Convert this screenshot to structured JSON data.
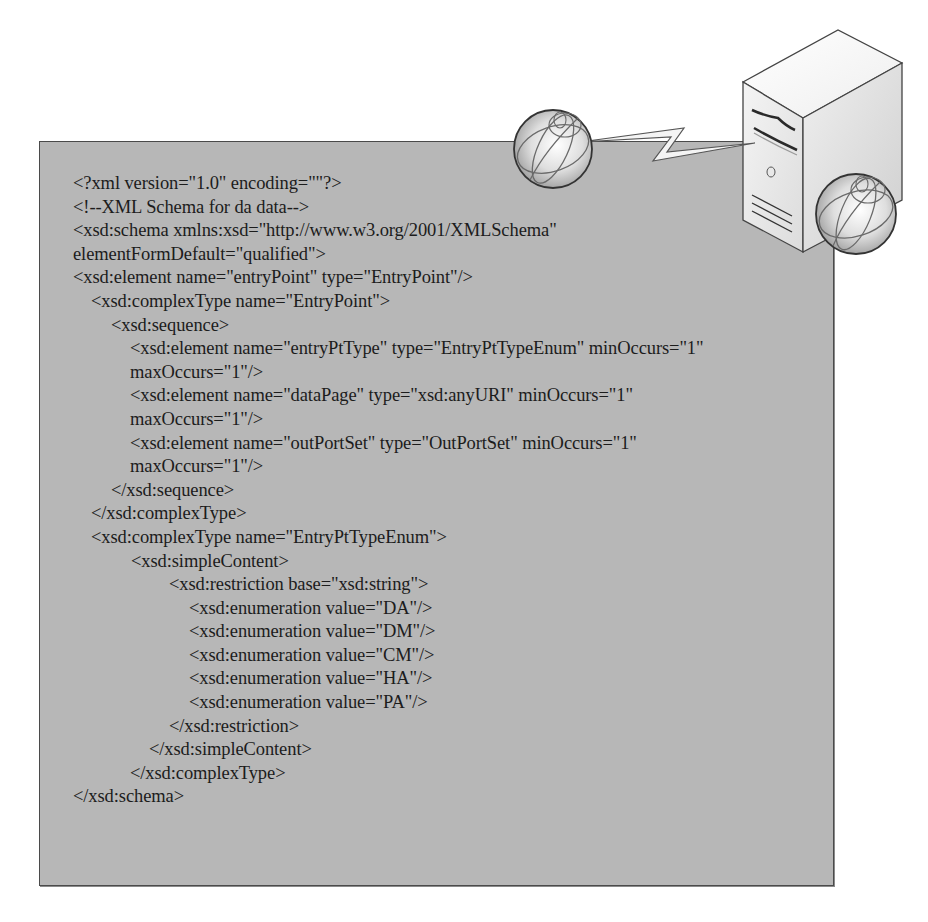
{
  "figure": {
    "panel": {
      "background": "#b7b7b7",
      "border": "#4a4a4a"
    },
    "code": {
      "language": "xml",
      "lines": [
        {
          "indent": 0,
          "text": "<?xml version=\"1.0\" encoding=\"\"?>"
        },
        {
          "indent": 0,
          "text": "<!--XML Schema for da data-->"
        },
        {
          "indent": 0,
          "text": "<xsd:schema xmlns:xsd=\"http://www.w3.org/2001/XMLSchema\""
        },
        {
          "indent": 0,
          "text": "elementFormDefault=\"qualified\">"
        },
        {
          "indent": 0,
          "text": "<xsd:element name=\"entryPoint\" type=\"EntryPoint\"/>"
        },
        {
          "indent": 1,
          "text": "<xsd:complexType name=\"EntryPoint\">"
        },
        {
          "indent": 2,
          "text": "<xsd:sequence>"
        },
        {
          "indent": 3,
          "text": "<xsd:element name=\"entryPtType\" type=\"EntryPtTypeEnum\" minOccurs=\"1\""
        },
        {
          "indent": 3,
          "text": "maxOccurs=\"1\"/>"
        },
        {
          "indent": 3,
          "text": "<xsd:element name=\"dataPage\" type=\"xsd:anyURI\" minOccurs=\"1\""
        },
        {
          "indent": 3,
          "text": "maxOccurs=\"1\"/>"
        },
        {
          "indent": 3,
          "text": "<xsd:element name=\"outPortSet\" type=\"OutPortSet\" minOccurs=\"1\""
        },
        {
          "indent": 3,
          "text": "maxOccurs=\"1\"/>"
        },
        {
          "indent": 2,
          "text": "</xsd:sequence>"
        },
        {
          "indent": 1,
          "text": "</xsd:complexType>"
        },
        {
          "indent": 1,
          "text": "<xsd:complexType name=\"EntryPtTypeEnum\">"
        },
        {
          "indent": 4,
          "text": "<xsd:simpleContent>"
        },
        {
          "indent": 6,
          "text": "<xsd:restriction base=\"xsd:string\">"
        },
        {
          "indent": 7,
          "text": "<xsd:enumeration value=\"DA\"/>"
        },
        {
          "indent": 7,
          "text": "<xsd:enumeration value=\"DM\"/>"
        },
        {
          "indent": 7,
          "text": "<xsd:enumeration value=\"CM\"/>"
        },
        {
          "indent": 7,
          "text": "<xsd:enumeration value=\"HA\"/>"
        },
        {
          "indent": 7,
          "text": "<xsd:enumeration value=\"PA\"/>"
        },
        {
          "indent": 6,
          "text": "</xsd:restriction>"
        },
        {
          "indent": 5,
          "text": "</xsd:simpleContent>"
        },
        {
          "indent": 3,
          "text": "</xsd:complexType>"
        },
        {
          "indent": 0,
          "text": "</xsd:schema>"
        }
      ]
    },
    "icons": {
      "globe_left": "globe-icon",
      "wireless_link": "lightning-bolt-icon",
      "server": "server-tower-icon",
      "globe_right": "globe-icon"
    }
  }
}
